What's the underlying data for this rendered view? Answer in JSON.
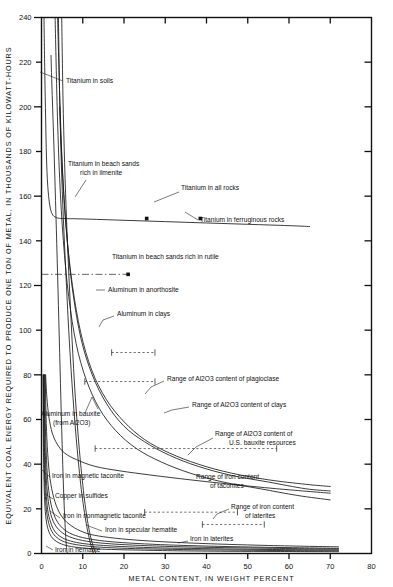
{
  "chart_data": {
    "type": "line",
    "title": "",
    "xlabel": "METAL CONTENT, IN WEIGHT PERCENT",
    "ylabel": "EQUIVALENT COAL ENERGY REQUIRED TO PRODUCE ONE TON OF METAL, IN THOUSANDS OF KILOWATT-HOURS",
    "xlim": [
      0,
      80
    ],
    "ylim": [
      0,
      240
    ],
    "xticks": [
      0,
      10,
      20,
      30,
      40,
      50,
      60,
      70,
      80
    ],
    "xticklabels": [
      "0",
      "10",
      "20",
      "30",
      "40",
      "50",
      "60",
      "70",
      "80"
    ],
    "yticks": [
      0,
      20,
      40,
      60,
      80,
      100,
      120,
      140,
      160,
      180,
      200,
      220,
      240
    ],
    "yticklabels": [
      "0",
      "20",
      "40",
      "60",
      "80",
      "100",
      "120",
      "140",
      "160",
      "180",
      "200",
      "220",
      "240"
    ],
    "grid": false,
    "legend": "none",
    "series": [
      {
        "name": "Titanium in all rocks",
        "points": [
          [
            0.6,
            240
          ],
          [
            0.8,
            215
          ],
          [
            1.0,
            195
          ],
          [
            1.2,
            178
          ],
          [
            1.5,
            165
          ],
          [
            2.0,
            156
          ],
          [
            2.6,
            152
          ],
          [
            3.5,
            150.5
          ],
          [
            5,
            150
          ],
          [
            10,
            149.8
          ],
          [
            20,
            149.2
          ],
          [
            30,
            148.6
          ],
          [
            40,
            148.0
          ],
          [
            50,
            147.4
          ],
          [
            60,
            146.8
          ],
          [
            65,
            146.4
          ]
        ]
      },
      {
        "name": "Titanium in soils",
        "points": [
          [
            2.3,
            223
          ],
          [
            2.6,
            205
          ],
          [
            3.0,
            183
          ],
          [
            3.4,
            158
          ],
          [
            3.8,
            132
          ],
          [
            4.2,
            104
          ],
          [
            4.6,
            76
          ],
          [
            5.0,
            49
          ],
          [
            5.4,
            26
          ],
          [
            5.8,
            10
          ],
          [
            6.1,
            2
          ],
          [
            6.3,
            0
          ]
        ]
      },
      {
        "name": "Titanium in beach sands rich in ilmenite",
        "points": [
          [
            4.9,
            240
          ],
          [
            5.2,
            205
          ],
          [
            5.6,
            175
          ],
          [
            6.1,
            148
          ],
          [
            6.7,
            122
          ],
          [
            7.4,
            96
          ],
          [
            8.2,
            70
          ],
          [
            9.2,
            46
          ],
          [
            10.3,
            26
          ],
          [
            11.4,
            12
          ],
          [
            12.4,
            4
          ],
          [
            13.2,
            0
          ]
        ]
      },
      {
        "name": "Titanium in beach sands rich in rutile",
        "points": [
          [
            4.1,
            240
          ],
          [
            4.4,
            205
          ],
          [
            4.8,
            175
          ],
          [
            5.3,
            150
          ],
          [
            5.9,
            126
          ],
          [
            6.6,
            100
          ],
          [
            7.4,
            76
          ],
          [
            8.4,
            52
          ],
          [
            9.5,
            31
          ],
          [
            10.7,
            15
          ],
          [
            11.8,
            5
          ],
          [
            12.6,
            0
          ]
        ]
      },
      {
        "name": "Titanium in ferruginous rocks",
        "points": [
          [
            33.0,
            150.0
          ]
        ]
      },
      {
        "name": "Aluminum in anorthosite",
        "points": [
          [
            3.3,
            240
          ],
          [
            3.8,
            200
          ],
          [
            4.4,
            168
          ],
          [
            5.3,
            140
          ],
          [
            6.6,
            115
          ],
          [
            8.4,
            94
          ],
          [
            10.8,
            78
          ],
          [
            14,
            65
          ],
          [
            18,
            55
          ],
          [
            23,
            47
          ],
          [
            29,
            41
          ],
          [
            36,
            36
          ],
          [
            44,
            32
          ],
          [
            53,
            29
          ],
          [
            62,
            26
          ],
          [
            70,
            24
          ]
        ]
      },
      {
        "name": "Aluminum in clays",
        "points": [
          [
            3.9,
            240
          ],
          [
            4.5,
            200
          ],
          [
            5.2,
            168
          ],
          [
            6.2,
            141
          ],
          [
            7.6,
            117
          ],
          [
            9.6,
            96
          ],
          [
            12.3,
            80
          ],
          [
            15.8,
            67
          ],
          [
            20,
            57
          ],
          [
            25,
            50
          ],
          [
            31,
            44
          ],
          [
            38,
            39
          ],
          [
            46,
            35
          ],
          [
            55,
            32
          ],
          [
            64,
            29
          ],
          [
            70,
            28
          ]
        ]
      },
      {
        "name": "Aluminum in bauxite (from Al2O3)",
        "points": [
          [
            4.4,
            200
          ],
          [
            5.1,
            170
          ],
          [
            6.1,
            143
          ],
          [
            7.5,
            120
          ],
          [
            9.5,
            99
          ],
          [
            12.2,
            82
          ],
          [
            15.7,
            69
          ],
          [
            20,
            59
          ],
          [
            25,
            51
          ],
          [
            31,
            45
          ],
          [
            38,
            40
          ],
          [
            46,
            36
          ],
          [
            55,
            33
          ],
          [
            64,
            31
          ],
          [
            70,
            30
          ]
        ]
      },
      {
        "name": "Aluminum in bauxite — low branch",
        "points": [
          [
            1.0,
            80
          ],
          [
            1.3,
            70
          ],
          [
            1.8,
            61
          ],
          [
            2.6,
            54
          ],
          [
            3.8,
            49
          ],
          [
            5.6,
            45
          ],
          [
            8.5,
            42
          ],
          [
            13,
            39
          ],
          [
            19,
            37
          ],
          [
            27,
            35
          ],
          [
            36,
            33
          ],
          [
            46,
            31
          ],
          [
            57,
            29
          ],
          [
            70,
            27
          ]
        ]
      },
      {
        "name": "Iron in magnetic taconite",
        "points": [
          [
            0.9,
            80
          ],
          [
            1.1,
            62
          ],
          [
            1.4,
            48
          ],
          [
            1.9,
            36
          ],
          [
            2.7,
            27
          ],
          [
            3.9,
            20
          ],
          [
            5.6,
            15
          ],
          [
            8,
            11.5
          ],
          [
            11,
            9
          ],
          [
            15,
            7.5
          ],
          [
            21,
            6.3
          ],
          [
            28,
            5.4
          ],
          [
            36,
            4.7
          ],
          [
            45,
            4.1
          ],
          [
            55,
            3.6
          ],
          [
            65,
            3.2
          ],
          [
            72,
            3.0
          ]
        ]
      },
      {
        "name": "Copper in sulfides",
        "points": [
          [
            0.75,
            80
          ],
          [
            0.9,
            60
          ],
          [
            1.15,
            45
          ],
          [
            1.5,
            33
          ],
          [
            2.1,
            24
          ],
          [
            3.0,
            17.5
          ],
          [
            4.3,
            13
          ],
          [
            6.2,
            9.8
          ],
          [
            9,
            7.6
          ],
          [
            13,
            6.1
          ],
          [
            18,
            5.1
          ],
          [
            25,
            4.3
          ],
          [
            33,
            3.7
          ],
          [
            43,
            3.2
          ],
          [
            54,
            2.8
          ],
          [
            65,
            2.5
          ],
          [
            72,
            2.3
          ]
        ]
      },
      {
        "name": "Iron in nonmagnetic taconite",
        "points": [
          [
            0.62,
            80
          ],
          [
            0.76,
            58
          ],
          [
            0.97,
            42
          ],
          [
            1.3,
            30
          ],
          [
            1.8,
            21.5
          ],
          [
            2.6,
            15.5
          ],
          [
            3.8,
            11.5
          ],
          [
            5.6,
            8.6
          ],
          [
            8.2,
            6.6
          ],
          [
            12,
            5.2
          ],
          [
            17,
            4.3
          ],
          [
            24,
            3.6
          ],
          [
            32,
            3.1
          ],
          [
            42,
            2.7
          ],
          [
            53,
            2.4
          ],
          [
            65,
            2.1
          ],
          [
            72,
            2.0
          ]
        ]
      },
      {
        "name": "Iron in specular hematite",
        "points": [
          [
            0.52,
            80
          ],
          [
            0.64,
            56
          ],
          [
            0.82,
            40
          ],
          [
            1.1,
            28
          ],
          [
            1.5,
            19.5
          ],
          [
            2.2,
            14
          ],
          [
            3.2,
            10
          ],
          [
            4.7,
            7.4
          ],
          [
            7,
            5.6
          ],
          [
            10.3,
            4.4
          ],
          [
            15,
            3.6
          ],
          [
            21,
            3.0
          ],
          [
            29,
            2.5
          ],
          [
            39,
            2.2
          ],
          [
            50,
            1.9
          ],
          [
            62,
            1.7
          ],
          [
            72,
            1.6
          ]
        ]
      },
      {
        "name": "Iron in laterites",
        "points": [
          [
            0.44,
            80
          ],
          [
            0.54,
            54
          ],
          [
            0.7,
            38
          ],
          [
            0.93,
            26
          ],
          [
            1.3,
            18
          ],
          [
            1.9,
            12.6
          ],
          [
            2.8,
            9.0
          ],
          [
            4.1,
            6.6
          ],
          [
            6.1,
            4.9
          ],
          [
            9,
            3.8
          ],
          [
            13,
            3.0
          ],
          [
            19,
            2.4
          ],
          [
            27,
            2.0
          ],
          [
            37,
            1.7
          ],
          [
            48,
            1.5
          ],
          [
            60,
            1.3
          ],
          [
            72,
            1.2
          ]
        ]
      },
      {
        "name": "Iron in hematite",
        "points": [
          [
            0.37,
            80
          ],
          [
            0.45,
            50
          ],
          [
            0.58,
            35
          ],
          [
            0.78,
            23
          ],
          [
            1.1,
            15.5
          ],
          [
            1.6,
            10.8
          ],
          [
            2.4,
            7.5
          ],
          [
            3.6,
            5.4
          ],
          [
            5.4,
            3.9
          ],
          [
            8,
            2.9
          ],
          [
            12,
            2.2
          ],
          [
            17,
            1.8
          ],
          [
            24,
            1.5
          ],
          [
            33,
            1.2
          ],
          [
            45,
            1.0
          ],
          [
            58,
            0.9
          ],
          [
            72,
            0.8
          ]
        ]
      }
    ],
    "range_bars": [
      {
        "label": "Range of Al2O3 content of plagioclase",
        "y": 90,
        "x_start": 17.0,
        "x_end": 27.5
      },
      {
        "label": "Range of Al2O3 content of clays",
        "y": 77,
        "x_start": 10.5,
        "x_end": 27.5
      },
      {
        "label": "Range of Al2O3 content of U.S. bauxite resources",
        "y": 47,
        "x_start": 13.0,
        "x_end": 57.0
      },
      {
        "label": "Range of iron content of taconites",
        "y": 18.5,
        "x_start": 25.0,
        "x_end": 47.5
      },
      {
        "label": "Range of iron content of laterites",
        "y": 13.0,
        "x_start": 39.0,
        "x_end": 54.0
      },
      {
        "label": "Titanium in beach sands rich in rutile",
        "y": 125,
        "x_start": 0.0,
        "x_end": 21.0
      }
    ],
    "markers": [
      {
        "label": "Titanium in all rocks",
        "x": 25.5,
        "y": 150
      },
      {
        "label": "Titanium in ferruginous rocks",
        "x": 38.5,
        "y": 150
      },
      {
        "label": "Titanium in beach sands rich in rutile",
        "x": 21.0,
        "y": 125
      }
    ],
    "annotations": [
      {
        "id": "ti-soils",
        "text": "Titanium in soils"
      },
      {
        "id": "ti-beach-ilmenite",
        "text": "Titanium in beach sands",
        "text2": "rich in ilmenite"
      },
      {
        "id": "ti-all-rocks",
        "text": "Titanium in all rocks"
      },
      {
        "id": "ti-ferruginous",
        "text": "Titanium in ferruginous rocks"
      },
      {
        "id": "ti-beach-rutile",
        "text": "Titanium in beach sands rich in rutile"
      },
      {
        "id": "al-anorthosite",
        "text": "Aluminum in anorthosite"
      },
      {
        "id": "al-clays",
        "text": "Aluminum in clays"
      },
      {
        "id": "al-bauxite",
        "text": "Aluminum in bauxite",
        "text2": "(from Al2O3)"
      },
      {
        "id": "range-plagioclase",
        "text": "Range of Al2O3 content of plagioclase"
      },
      {
        "id": "range-clays",
        "text": "Range of Al2O3 content of clays"
      },
      {
        "id": "range-bauxite",
        "text": "Range of Al2O3 content of",
        "text2": "U.S. bauxite resources"
      },
      {
        "id": "fe-magnetic-taconite",
        "text": "Iron in magnetic taconite"
      },
      {
        "id": "cu-sulfides",
        "text": "Copper in sulfides"
      },
      {
        "id": "fe-nonmagnetic-taconite",
        "text": "Iron in nonmagnetic taconite"
      },
      {
        "id": "fe-specular-hematite",
        "text": "Iron in specular hematite"
      },
      {
        "id": "range-taconites",
        "text": "Range of iron content",
        "text2": "of taconites"
      },
      {
        "id": "range-laterites",
        "text": "Range of iron content",
        "text2": "of laterites"
      },
      {
        "id": "fe-laterites",
        "text": "Iron in laterites"
      },
      {
        "id": "fe-hematite",
        "text": "Iron in hematite"
      }
    ],
    "colors": {
      "line": "#1a1a1a",
      "axis": "#111111",
      "background": "#ffffff"
    }
  }
}
